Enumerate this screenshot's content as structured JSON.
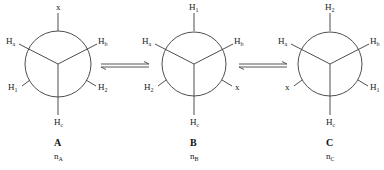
{
  "figure": {
    "equilibrium_symbol": "⇌",
    "conformers": [
      {
        "id": "A",
        "name": "A",
        "population_base": "n",
        "population_sub": "A",
        "center": [
          58,
          64
        ],
        "front": {
          "top_left": {
            "base": "H",
            "sub": "a"
          },
          "top_right": {
            "base": "H",
            "sub": "b"
          },
          "bottom": {
            "base": "H",
            "sub": "c"
          }
        },
        "back": {
          "top": {
            "base": "x",
            "sub": ""
          },
          "bottom_left": {
            "base": "H",
            "sub": "1"
          },
          "bottom_right": {
            "base": "H",
            "sub": "2"
          }
        }
      },
      {
        "id": "B",
        "name": "B",
        "population_base": "n",
        "population_sub": "B",
        "center": [
          194,
          64
        ],
        "front": {
          "top_left": {
            "base": "H",
            "sub": "a"
          },
          "top_right": {
            "base": "H",
            "sub": "b"
          },
          "bottom": {
            "base": "H",
            "sub": "c"
          }
        },
        "back": {
          "top": {
            "base": "H",
            "sub": "1"
          },
          "bottom_left": {
            "base": "H",
            "sub": "2"
          },
          "bottom_right": {
            "base": "x",
            "sub": ""
          }
        }
      },
      {
        "id": "C",
        "name": "C",
        "population_base": "n",
        "population_sub": "C",
        "center": [
          330,
          64
        ],
        "front": {
          "top_left": {
            "base": "H",
            "sub": "a"
          },
          "top_right": {
            "base": "H",
            "sub": "b"
          },
          "bottom": {
            "base": "H",
            "sub": "c"
          }
        },
        "back": {
          "top": {
            "base": "H",
            "sub": "2"
          },
          "bottom_left": {
            "base": "x",
            "sub": ""
          },
          "bottom_right": {
            "base": "H",
            "sub": "1"
          }
        }
      }
    ],
    "arrows": [
      {
        "from": "A",
        "to": "B",
        "type": "equilibrium"
      },
      {
        "from": "B",
        "to": "C",
        "type": "equilibrium"
      }
    ]
  }
}
